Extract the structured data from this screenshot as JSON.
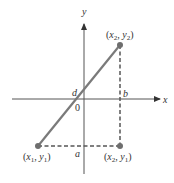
{
  "diagram": {
    "axes": {
      "x_label": "x",
      "y_label": "y",
      "origin_label": "0"
    },
    "points": [
      {
        "id": "p1",
        "label_main_x": "x",
        "label_sub_x": "1",
        "label_main_y": "y",
        "label_sub_y": "1",
        "px": 38,
        "py": 146
      },
      {
        "id": "p2",
        "label_main_x": "x",
        "label_sub_x": "2",
        "label_main_y": "y",
        "label_sub_y": "2",
        "px": 120,
        "py": 45
      },
      {
        "id": "p3",
        "label_main_x": "x",
        "label_sub_x": "2",
        "label_main_y": "y",
        "label_sub_y": "1",
        "px": 120,
        "py": 146
      }
    ],
    "segment_labels": {
      "d": "d",
      "a": "a",
      "b": "b"
    },
    "colors": {
      "segment": "#7a7a7a",
      "point": "#6e6e6e",
      "axis": "#555555",
      "dashed": "#555555"
    }
  }
}
